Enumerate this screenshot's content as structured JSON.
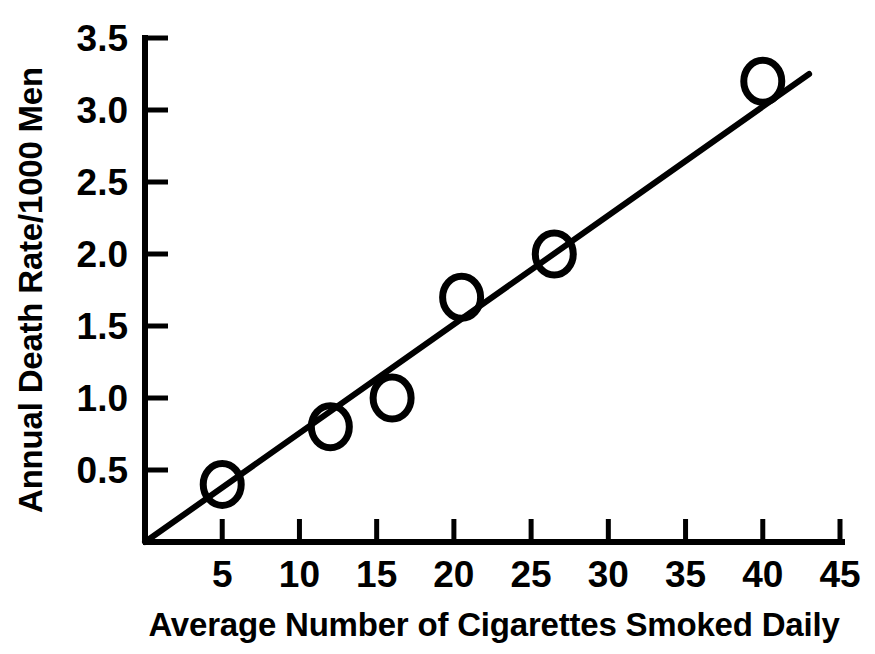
{
  "chart_data": {
    "type": "scatter",
    "title": "",
    "xlabel": "Average Number of Cigarettes Smoked Daily",
    "ylabel": "Annual Death Rate/1000 Men",
    "xlim": [
      0,
      45
    ],
    "ylim": [
      0,
      3.5
    ],
    "grid": false,
    "legend": "none",
    "x_ticks": [
      5,
      10,
      15,
      20,
      25,
      30,
      35,
      40,
      45
    ],
    "x_tick_labels": [
      "5",
      "10",
      "15",
      "20",
      "25",
      "30",
      "35",
      "40",
      "45"
    ],
    "y_ticks": [
      0.5,
      1.0,
      1.5,
      2.0,
      2.5,
      3.0,
      3.5
    ],
    "y_tick_labels": [
      "0.5",
      "1.0",
      "1.5",
      "2.0",
      "2.5",
      "3.0",
      "3.5"
    ],
    "marker": "open-circle",
    "marker_color": "#000000",
    "points": [
      {
        "x": 5,
        "y": 0.4
      },
      {
        "x": 12,
        "y": 0.8
      },
      {
        "x": 16,
        "y": 1.0
      },
      {
        "x": 20.5,
        "y": 1.7
      },
      {
        "x": 26.5,
        "y": 2.0
      },
      {
        "x": 40,
        "y": 3.2
      }
    ],
    "series": [
      {
        "name": "Annual death rate vs cigarettes smoked",
        "x": [
          5,
          12,
          16,
          20.5,
          26.5,
          40
        ],
        "values": [
          0.4,
          0.8,
          1.0,
          1.7,
          2.0,
          3.2
        ]
      }
    ],
    "trend_line": {
      "type": "line",
      "color": "#000000",
      "x_start": 0,
      "y_start": 0,
      "x_end": 43,
      "y_end": 3.25,
      "slope": 0.0756,
      "intercept": 0
    }
  },
  "axes": {
    "x_axis_label": "Average Number of Cigarettes Smoked Daily",
    "y_axis_label": "Annual Death Rate/1000 Men"
  }
}
